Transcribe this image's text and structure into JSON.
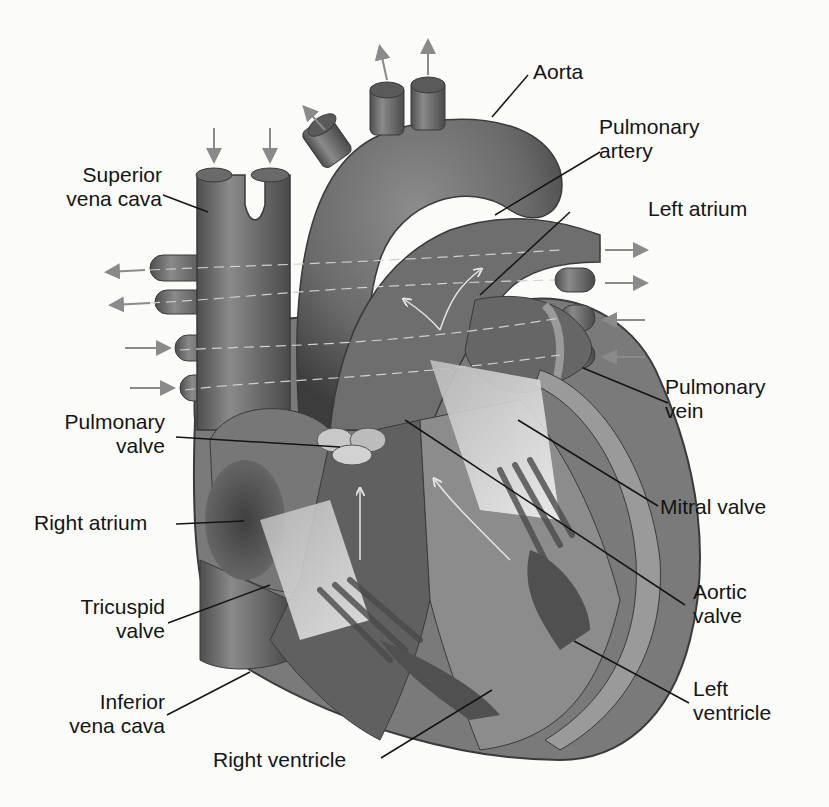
{
  "diagram": {
    "type": "anatomical",
    "colors": {
      "background": "#fbfbfa",
      "tissue_dark": "#5a5a5a",
      "tissue_mid": "#7d7d7d",
      "tissue_light": "#a9a9a9",
      "flow_arrow": "#8a8a8a",
      "leader_line": "#141414",
      "label_text": "#141414"
    },
    "labels": {
      "aorta": "Aorta",
      "pulmonary_artery_1": "Pulmonary",
      "pulmonary_artery_2": "artery",
      "superior_vena_cava_1": "Superior",
      "superior_vena_cava_2": "vena cava",
      "left_atrium": "Left atrium",
      "pulmonary_vein_1": "Pulmonary",
      "pulmonary_vein_2": "vein",
      "pulmonary_valve_1": "Pulmonary",
      "pulmonary_valve_2": "valve",
      "mitral_valve": "Mitral valve",
      "right_atrium": "Right atrium",
      "tricuspid_valve_1": "Tricuspid",
      "tricuspid_valve_2": "valve",
      "aortic_valve_1": "Aortic",
      "aortic_valve_2": "valve",
      "inferior_vena_cava_1": "Inferior",
      "inferior_vena_cava_2": "vena cava",
      "left_ventricle_1": "Left",
      "left_ventricle_2": "ventricle",
      "right_ventricle": "Right ventricle"
    }
  }
}
